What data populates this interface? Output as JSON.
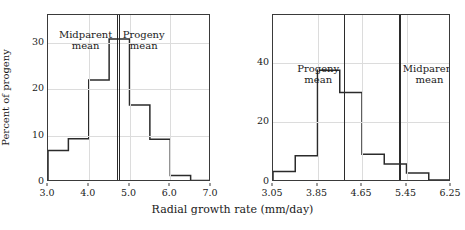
{
  "figure": {
    "xaxis_title": "Radial growth rate (mm/day)",
    "yaxis_title": "Percent of progeny"
  },
  "chart_data": [
    {
      "type": "bar",
      "panel": "left",
      "title": "",
      "xlabel": "Radial growth rate (mm/day)",
      "ylabel": "Percent of progeny",
      "xlim": [
        3.0,
        7.0
      ],
      "ylim": [
        0,
        36
      ],
      "grid": true,
      "bin_width": 0.5,
      "bin_edges": [
        3.0,
        3.5,
        4.0,
        4.5,
        5.0,
        5.5,
        6.0,
        6.5,
        7.0
      ],
      "categories": [
        "3.0-3.5",
        "3.5-4.0",
        "4.0-4.5",
        "4.5-5.0",
        "5.0-5.5",
        "5.5-6.0",
        "6.0-6.5",
        "6.5-7.0"
      ],
      "values": [
        6.8,
        9.3,
        22.0,
        30.8,
        16.6,
        9.2,
        1.4,
        0.3
      ],
      "xticks": [
        3.0,
        4.0,
        5.0,
        6.0,
        7.0
      ],
      "xtick_labels": [
        "3.0",
        "4.0",
        "5.0",
        "6.0",
        "7.0"
      ],
      "yticks": [
        0,
        10,
        20,
        30
      ],
      "ytick_labels": [
        "0",
        "10",
        "20",
        "30"
      ],
      "annotations": [
        {
          "label_line1": "Midparent",
          "label_line2": "mean",
          "x": 4.7,
          "side": "left"
        },
        {
          "label_line1": "Progeny",
          "label_line2": "mean",
          "x": 4.76,
          "side": "right"
        }
      ]
    },
    {
      "type": "bar",
      "panel": "right",
      "title": "",
      "xlabel": "Radial growth rate (mm/day)",
      "ylabel": "",
      "xlim": [
        3.05,
        6.25
      ],
      "ylim": [
        0,
        56
      ],
      "grid": true,
      "bin_width": 0.4,
      "bin_edges": [
        3.05,
        3.45,
        3.85,
        4.25,
        4.65,
        5.05,
        5.45,
        5.85,
        6.25
      ],
      "categories": [
        "3.05-3.45",
        "3.45-3.85",
        "3.85-4.25",
        "4.25-4.65",
        "4.65-5.05",
        "5.05-5.45",
        "5.45-5.85",
        "5.85-6.25"
      ],
      "values": [
        3.5,
        8.8,
        37.5,
        30.0,
        9.3,
        6.0,
        3.0,
        0.7
      ],
      "xticks": [
        3.05,
        3.85,
        4.65,
        5.45,
        6.25
      ],
      "xtick_labels": [
        "3.05",
        "3.85",
        "4.65",
        "5.45",
        "6.25"
      ],
      "yticks": [
        0,
        20,
        40
      ],
      "ytick_labels": [
        "0",
        "20",
        "40"
      ],
      "annotations": [
        {
          "label_line1": "Progeny",
          "label_line2": "mean",
          "x": 4.33,
          "side": "left"
        },
        {
          "label_line1": "Midparent",
          "label_line2": "mean",
          "x": 5.33,
          "side": "right"
        }
      ]
    }
  ]
}
